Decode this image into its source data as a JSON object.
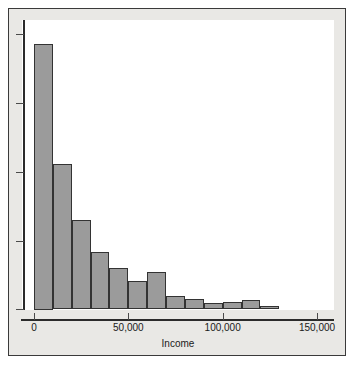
{
  "chart_data": {
    "type": "bar",
    "title": "",
    "subtitle": "",
    "xlabel": "Income",
    "ylabel": "",
    "grid": false,
    "legend": "none",
    "xlim": [
      0,
      150000
    ],
    "ylim": [
      0,
      1
    ],
    "bin_width": 10000,
    "x_tick_labels": [
      "0",
      "50,000",
      "100,000",
      "150,000"
    ],
    "x_tick_values": [
      0,
      50000,
      100000,
      150000
    ],
    "y_tick_labels": [],
    "y_tick_count": 5,
    "categories": [
      "0–10,000",
      "10,000–20,000",
      "20,000–30,000",
      "30,000–40,000",
      "40,000–50,000",
      "50,000–60,000",
      "60,000–70,000",
      "70,000–80,000",
      "80,000–90,000",
      "90,000–100,000",
      "100,000–110,000",
      "110,000–120,000",
      "120,000–130,000"
    ],
    "bin_starts": [
      0,
      10000,
      20000,
      30000,
      40000,
      50000,
      60000,
      70000,
      80000,
      90000,
      100000,
      110000,
      120000
    ],
    "values": [
      264,
      145,
      89,
      57,
      41,
      28,
      37,
      13,
      10,
      6,
      7,
      9,
      3
    ],
    "bar_fill": "#9b9b9b",
    "bar_edge": "#333333",
    "panel_background": "#e9e8e5",
    "plot_background": "#ffffff",
    "axis_color": "#2b2b2b"
  }
}
